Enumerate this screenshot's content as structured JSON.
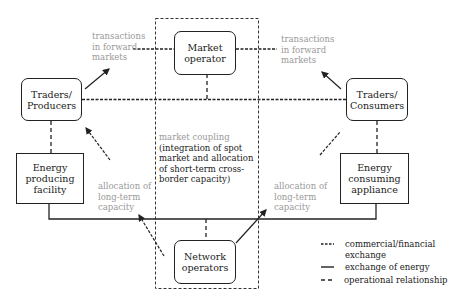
{
  "nodes": {
    "market_operator": "Market operator",
    "traders_producers": "Traders/ Producers",
    "traders_consumers": "Traders/ Consumers",
    "energy_producing": "Energy producing facility",
    "energy_consuming": "Energy consuming appliance",
    "network_operators": "Network operators"
  },
  "labels": {
    "forward_left": [
      "transactions",
      "in forward",
      "markets"
    ],
    "forward_right": [
      "transactions",
      "in forward",
      "markets"
    ],
    "alloc_left": [
      "allocation of",
      "long-term",
      "capacity"
    ],
    "alloc_right": [
      "allocation of",
      "long-term",
      "capacity"
    ],
    "coupling_title": "market coupling",
    "coupling_body": [
      "(integration of spot",
      "market and allocation",
      "of short-term cross-",
      "border capacity)"
    ]
  },
  "legend": [
    {
      "style": "short-dash",
      "label": "commercial/financial exchange"
    },
    {
      "style": "solid",
      "label": "exchange of energy"
    },
    {
      "style": "long-dash",
      "label": "operational relationship"
    }
  ],
  "colors": {
    "line": "#222222",
    "grey_text": "#999999"
  }
}
